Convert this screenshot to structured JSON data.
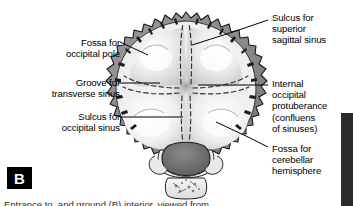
{
  "figure": {
    "panel_letter": "B",
    "caption": "Entrance to, and ground (B) interior, viewed from",
    "colors": {
      "bone_rim": "#8c8c8c",
      "bone_rim_dark": "#6e6e6e",
      "fossa_light": "#f2f2f2",
      "fossa_mid": "#d9d9d9",
      "foramen_magnum": "#6b6b6b",
      "outline": "#1a1a1a",
      "dashed_groove": "#3a3a3a",
      "leader_line": "#000000",
      "panel_badge_bg": "#000000",
      "panel_badge_fg": "#ffffff",
      "edge_bar": "#2b2b2b",
      "background": "#ffffff"
    }
  },
  "labels": {
    "left": [
      {
        "id": "fossa-occipital-pole",
        "lines": [
          "Fossa for",
          "occipital pole"
        ],
        "x": 36,
        "y": 38,
        "width": 84
      },
      {
        "id": "groove-transverse-sinus",
        "lines": [
          "Groove for",
          "transverse sinus"
        ],
        "x": 17,
        "y": 78,
        "width": 103
      },
      {
        "id": "sulcus-occipital-sinus",
        "lines": [
          "Sulcus for",
          "occipital sinus"
        ],
        "x": 24,
        "y": 112,
        "width": 96
      }
    ],
    "right": [
      {
        "id": "sulcus-superior-sagittal-sinus",
        "lines": [
          "Sulcus for",
          "superior",
          "sagittal sinus"
        ],
        "x": 271,
        "y": 13,
        "width": 82
      },
      {
        "id": "internal-occipital-protuberance",
        "lines": [
          "Internal",
          "occipital",
          "protuberance",
          "(confluens",
          "of sinuses)"
        ],
        "x": 271,
        "y": 79,
        "width": 82
      },
      {
        "id": "fossa-cerebellar-hemisphere",
        "lines": [
          "Fossa for",
          "cerebellar",
          "hemisphere"
        ],
        "x": 271,
        "y": 144,
        "width": 82
      }
    ]
  },
  "leader_lines": [
    {
      "id": "leader-fossa-occipital-pole",
      "from": [
        122,
        43
      ],
      "to": [
        146,
        55
      ]
    },
    {
      "id": "leader-groove-transverse-sinus",
      "from": [
        122,
        83
      ],
      "to": [
        158,
        83
      ]
    },
    {
      "id": "leader-sulcus-occipital-sinus",
      "from": [
        122,
        117
      ],
      "to": [
        182,
        117
      ]
    },
    {
      "id": "leader-sulcus-superior-sagittal-sinus",
      "from": [
        268,
        20
      ],
      "to": [
        193,
        42
      ]
    },
    {
      "id": "leader-internal-occipital-protuberance",
      "from": [
        268,
        86
      ],
      "to": [
        196,
        86
      ]
    },
    {
      "id": "leader-fossa-cerebellar-hemisphere",
      "from": [
        268,
        148
      ],
      "to": [
        218,
        126
      ]
    }
  ],
  "chart_data": {
    "type": "diagram",
    "annotations": [
      "Fossa for occipital pole",
      "Groove for transverse sinus",
      "Sulcus for occipital sinus",
      "Sulcus for superior sagittal sinus",
      "Internal occipital protuberance (confluens of sinuses)",
      "Fossa for cerebellar hemisphere"
    ]
  }
}
